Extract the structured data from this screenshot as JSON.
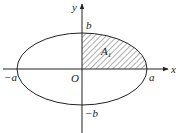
{
  "diagram": {
    "type": "ellipse-quadrant",
    "colors": {
      "stroke": "#222222",
      "background": "#ffffff",
      "hatch": "#333333"
    },
    "axes": {
      "x_label": "x",
      "y_label": "y",
      "origin_label": "O"
    },
    "ticks": {
      "pos_a": "a",
      "neg_a": "−a",
      "pos_b": "b",
      "neg_b": "−b"
    },
    "region": {
      "label": "A",
      "subscript": "1",
      "description": "First-quadrant portion of ellipse, hatched"
    }
  }
}
